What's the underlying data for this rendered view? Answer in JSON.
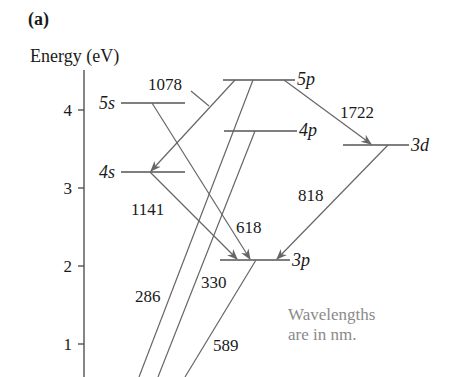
{
  "panel_label": "(a)",
  "axis": {
    "label": "Energy (eV)",
    "ticks": [
      "4",
      "3",
      "2",
      "1"
    ]
  },
  "levels": {
    "5s": "5s",
    "4s": "4s",
    "5p": "5p",
    "4p": "4p",
    "3d": "3d",
    "3p": "3p"
  },
  "wavelengths": {
    "w1078": "1078",
    "w1722": "1722",
    "w1141": "1141",
    "w818": "818",
    "w618": "618",
    "w286": "286",
    "w330": "330",
    "w589": "589"
  },
  "note": {
    "line1": "Wavelengths",
    "line2": "are in nm."
  },
  "colors": {
    "line": "#555555",
    "text": "#1a1a1a",
    "note": "#8a8a8a"
  }
}
